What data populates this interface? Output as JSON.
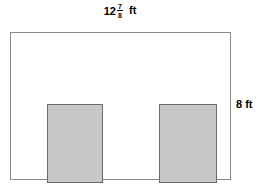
{
  "figure": {
    "type": "geometry-diagram",
    "outer_rectangle": {
      "name": "room-outline",
      "fill_color": "#ffffff",
      "border_color": "#8a8a8a",
      "width_label": "12 7/8 ft",
      "height_label": "8 ft"
    },
    "inner_rectangles": [
      {
        "name": "shaded-region-left",
        "fill_color": "#c8c8c8",
        "border_color": "#6a6a6a"
      },
      {
        "name": "shaded-region-right",
        "fill_color": "#c8c8c8",
        "border_color": "#6a6a6a"
      }
    ]
  },
  "labels": {
    "top": {
      "whole": "12",
      "numerator": "7",
      "denominator": "8",
      "unit": "ft",
      "full_text": "12 7/8 ft"
    },
    "right": {
      "value": "8",
      "unit": "ft",
      "full_text": "8 ft"
    }
  },
  "chart_data": {
    "type": "diagram",
    "title": "",
    "shapes": [
      {
        "id": "outer",
        "kind": "rectangle",
        "role": "room-boundary",
        "width_value": 12.875,
        "width_label": "12 7/8 ft",
        "height_value": 8,
        "height_label": "8 ft",
        "unit": "ft",
        "fill": "#ffffff",
        "stroke": "#8a8a8a"
      },
      {
        "id": "left-shaded",
        "kind": "rectangle",
        "role": "shaded-region",
        "fill": "#c8c8c8",
        "stroke": "#6a6a6a"
      },
      {
        "id": "right-shaded",
        "kind": "rectangle",
        "role": "shaded-region",
        "fill": "#c8c8c8",
        "stroke": "#6a6a6a"
      }
    ],
    "annotations": [
      {
        "position": "top",
        "text": "12 7/8 ft"
      },
      {
        "position": "right",
        "text": "8 ft"
      }
    ]
  }
}
